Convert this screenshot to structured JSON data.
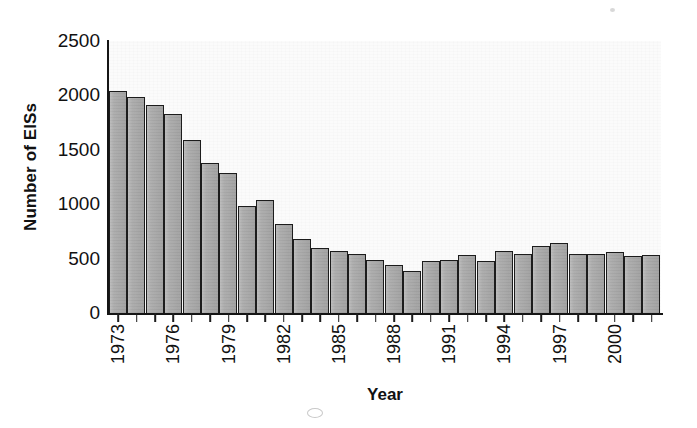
{
  "chart_data": {
    "type": "bar",
    "title": "",
    "xlabel": "Year",
    "ylabel": "Number of EISs",
    "ylim": [
      0,
      2500
    ],
    "yticks": [
      0,
      500,
      1000,
      1500,
      2000,
      2500
    ],
    "ytick_labels": [
      "0",
      "500",
      "1000",
      "1500",
      "2000",
      "2500"
    ],
    "grid": false,
    "legend": null,
    "xtick_label_rotation": 90,
    "xtick_label_interval": 3,
    "categories": [
      "1973",
      "1974",
      "1975",
      "1976",
      "1977",
      "1978",
      "1979",
      "1980",
      "1981",
      "1982",
      "1983",
      "1984",
      "1985",
      "1986",
      "1987",
      "1988",
      "1989",
      "1990",
      "1991",
      "1992",
      "1993",
      "1994",
      "1995",
      "1996",
      "1997",
      "1998",
      "1999",
      "2000",
      "2001",
      "2002"
    ],
    "visible_xtick_labels": [
      "1973",
      "1976",
      "1979",
      "1982",
      "1985",
      "1988",
      "1991",
      "1994",
      "1997",
      "2000"
    ],
    "values": [
      2040,
      1990,
      1910,
      1830,
      1590,
      1380,
      1290,
      980,
      1040,
      820,
      680,
      600,
      570,
      540,
      490,
      440,
      390,
      480,
      490,
      530,
      480,
      570,
      540,
      620,
      640,
      540,
      540,
      560,
      520,
      530
    ],
    "bar_fill_color": "#a9a9a9",
    "bar_edge_color": "#1c1c1c",
    "plot_background_color": "#fbfbfb",
    "axis_color": "#151515"
  },
  "axes": {
    "y_title": "Number of EISs",
    "x_title": "Year"
  }
}
